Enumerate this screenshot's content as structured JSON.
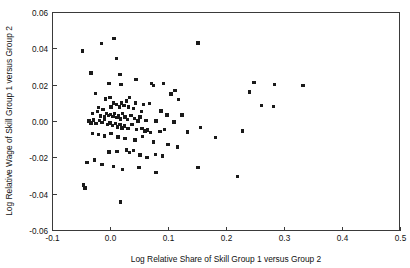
{
  "chart_data": {
    "type": "scatter",
    "title": "",
    "xlabel": "Log Relative Share of Skill Group 1 versus Group 2",
    "ylabel": "Log Relative Wage of Skill Group 1 versus Group 2",
    "xlim": [
      -0.1,
      0.5
    ],
    "ylim": [
      -0.06,
      0.06
    ],
    "xticks": [
      -0.1,
      0.0,
      0.1,
      0.2,
      0.3,
      0.4,
      0.5
    ],
    "xtick_labels": [
      "-0.1",
      "0.0",
      "0.1",
      "0.2",
      "0.3",
      "0.4",
      "0.5"
    ],
    "yticks": [
      -0.06,
      -0.04,
      -0.02,
      0.0,
      0.02,
      0.04,
      0.06
    ],
    "ytick_labels": [
      "-0.06",
      "-0.04",
      "-0.02",
      "0.00",
      "0.02",
      "0.04",
      "0.06"
    ],
    "grid": false,
    "legend": null,
    "marker": "square",
    "marker_color": "#1a1a1a",
    "marker_size": 3.4,
    "n_points": 121,
    "points": [
      [
        -0.047,
        0.0385
      ],
      [
        -0.015,
        0.0425
      ],
      [
        0.007,
        0.0455
      ],
      [
        0.152,
        0.043
      ],
      [
        -0.033,
        0.0265
      ],
      [
        -0.002,
        0.0208
      ],
      [
        0.011,
        0.0345
      ],
      [
        0.017,
        0.0255
      ],
      [
        0.045,
        0.023
      ],
      [
        0.019,
        0.02
      ],
      [
        -0.025,
        0.015
      ],
      [
        -0.008,
        0.0122
      ],
      [
        0.0,
        0.0128
      ],
      [
        0.006,
        0.01
      ],
      [
        0.034,
        0.013
      ],
      [
        0.044,
        0.01
      ],
      [
        0.072,
        0.0205
      ],
      [
        0.075,
        0.0195
      ],
      [
        0.092,
        0.0207
      ],
      [
        0.105,
        0.0148
      ],
      [
        0.112,
        0.0167
      ],
      [
        0.118,
        0.012
      ],
      [
        0.248,
        0.0212
      ],
      [
        0.24,
        0.016
      ],
      [
        0.284,
        0.02
      ],
      [
        0.333,
        0.0195
      ],
      [
        0.261,
        0.0085
      ],
      [
        0.282,
        0.008
      ],
      [
        -0.02,
        0.0075
      ],
      [
        -0.012,
        0.0062
      ],
      [
        0.002,
        0.0078
      ],
      [
        0.011,
        0.009
      ],
      [
        0.016,
        0.0078
      ],
      [
        0.02,
        0.01
      ],
      [
        0.024,
        0.0085
      ],
      [
        0.028,
        0.011
      ],
      [
        0.032,
        0.0078
      ],
      [
        0.04,
        0.007
      ],
      [
        0.058,
        0.0092
      ],
      [
        0.068,
        0.0098
      ],
      [
        0.054,
        0.0052
      ],
      [
        0.088,
        0.0055
      ],
      [
        0.098,
        0.0032
      ],
      [
        0.124,
        0.0032
      ],
      [
        -0.03,
        0.004
      ],
      [
        -0.022,
        0.0052
      ],
      [
        -0.016,
        0.0028
      ],
      [
        -0.01,
        0.0022
      ],
      [
        -0.006,
        0.0042
      ],
      [
        -0.003,
        0.003
      ],
      [
        0.001,
        0.0035
      ],
      [
        0.005,
        0.0025
      ],
      [
        0.008,
        0.004
      ],
      [
        0.012,
        0.0018
      ],
      [
        0.015,
        0.003
      ],
      [
        0.018,
        0.0012
      ],
      [
        0.022,
        0.004
      ],
      [
        0.026,
        0.0022
      ],
      [
        0.03,
        0.0008
      ],
      [
        0.036,
        0.003
      ],
      [
        0.042,
        0.0015
      ],
      [
        0.048,
        0.0
      ],
      [
        0.052,
        0.0022
      ],
      [
        0.062,
        0.0002
      ],
      [
        0.079,
        0.0
      ],
      [
        0.11,
        -0.0005
      ],
      [
        0.156,
        -0.0035
      ],
      [
        -0.036,
        0.0
      ],
      [
        -0.033,
        -0.001
      ],
      [
        -0.028,
        0.0005
      ],
      [
        -0.024,
        -0.0015
      ],
      [
        -0.018,
        0.0002
      ],
      [
        -0.014,
        -0.0008
      ],
      [
        -0.009,
        0.001
      ],
      [
        -0.004,
        -0.0018
      ],
      [
        0.0,
        -0.001
      ],
      [
        0.004,
        -0.0025
      ],
      [
        0.009,
        -0.0015
      ],
      [
        0.013,
        -0.0032
      ],
      [
        0.017,
        -0.002
      ],
      [
        0.021,
        -0.0038
      ],
      [
        0.025,
        -0.0028
      ],
      [
        0.031,
        -0.0042
      ],
      [
        0.038,
        -0.002
      ],
      [
        0.046,
        -0.0048
      ],
      [
        0.055,
        -0.004
      ],
      [
        0.06,
        -0.0055
      ],
      [
        0.065,
        -0.005
      ],
      [
        0.07,
        -0.0062
      ],
      [
        0.086,
        -0.0058
      ],
      [
        0.094,
        -0.0048
      ],
      [
        0.134,
        -0.006
      ],
      [
        0.182,
        -0.009
      ],
      [
        0.228,
        -0.0055
      ],
      [
        -0.03,
        -0.0068
      ],
      [
        -0.02,
        -0.0075
      ],
      [
        -0.01,
        -0.0082
      ],
      [
        0.002,
        -0.007
      ],
      [
        0.014,
        -0.0088
      ],
      [
        0.026,
        -0.0095
      ],
      [
        0.043,
        -0.0105
      ],
      [
        0.056,
        -0.0085
      ],
      [
        0.075,
        -0.0115
      ],
      [
        0.1,
        -0.0128
      ],
      [
        0.116,
        -0.0142
      ],
      [
        -0.002,
        -0.017
      ],
      [
        0.012,
        -0.0168
      ],
      [
        0.028,
        -0.016
      ],
      [
        0.034,
        -0.0175
      ],
      [
        0.04,
        -0.0162
      ],
      [
        0.052,
        -0.0188
      ],
      [
        0.064,
        -0.02
      ],
      [
        0.078,
        -0.0185
      ],
      [
        0.091,
        -0.0192
      ],
      [
        -0.04,
        -0.0228
      ],
      [
        -0.027,
        -0.0215
      ],
      [
        -0.014,
        -0.0238
      ],
      [
        0.006,
        -0.025
      ],
      [
        0.022,
        -0.0268
      ],
      [
        0.05,
        -0.0255
      ],
      [
        0.079,
        -0.0282
      ],
      [
        0.152,
        -0.0255
      ],
      [
        0.22,
        -0.0305
      ],
      [
        -0.046,
        -0.0352
      ],
      [
        -0.043,
        -0.0368
      ],
      [
        0.018,
        -0.0445
      ]
    ]
  },
  "plot_geometry": {
    "left": 52,
    "right": 400,
    "top": 12,
    "bottom": 230
  }
}
